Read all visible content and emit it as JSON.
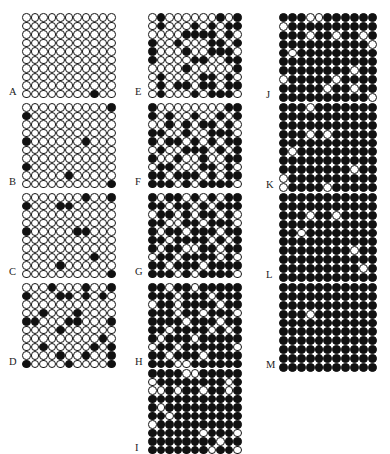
{
  "figure": {
    "type": "panel-matrix-of-circle-lattices",
    "legend": {
      "open_circle": "open circle (unoccupied / white)",
      "filled_circle": "filled circle (occupied / black)"
    },
    "columns": 3,
    "geometry": {
      "grid_cols": 11,
      "grid_rows": 10,
      "cell_px": 8.6,
      "circle_px": 8.6
    },
    "panels": [
      {
        "label": "A",
        "column": 1,
        "x": 26,
        "y": 13,
        "cell": 8.5,
        "rows": [
          "00000000000",
          "00000000000",
          "00000000000",
          "00000000000",
          "00000000000",
          "00000000000",
          "00000000000",
          "00000000000",
          "00000000000",
          "00000000100"
        ]
      },
      {
        "label": "B",
        "column": 1,
        "x": 26,
        "y": 103,
        "cell": 8.5,
        "rows": [
          "00000000001",
          "10000000000",
          "00000000000",
          "00000000000",
          "10000001000",
          "00000000000",
          "00000000000",
          "10000000000",
          "00000100000",
          "00000000001"
        ]
      },
      {
        "label": "C",
        "column": 1,
        "x": 26,
        "y": 193,
        "cell": 8.5,
        "rows": [
          "00000001001",
          "10001100000",
          "00000000000",
          "00000000000",
          "10000011000",
          "00000000000",
          "00000000000",
          "00000000100",
          "00001000000",
          "00000000001"
        ]
      },
      {
        "label": "D",
        "column": 1,
        "x": 26,
        "y": 283,
        "cell": 8.5,
        "rows": [
          "00010001001",
          "10001101010",
          "00000000000",
          "00100010000",
          "11000110001",
          "00001000000",
          "00000000010",
          "00100000101",
          "00001001001",
          "10000100001"
        ]
      },
      {
        "label": "E",
        "column": 2,
        "x": 152,
        "y": 13,
        "cell": 8.5,
        "rows": [
          "01000000101",
          "01000101011",
          "00001111010",
          "10010001101",
          "10001001110",
          "10000110011",
          "00001000001",
          "01000011010",
          "01011011011",
          "01000101110"
        ]
      },
      {
        "label": "F",
        "column": 2,
        "x": 152,
        "y": 103,
        "cell": 8.5,
        "rows": [
          "10000000011",
          "10100100101",
          "00101011010",
          "11001001110",
          "10110101011",
          "01001110101",
          "10010010011",
          "01100011010",
          "11011101011",
          "11101011110"
        ]
      },
      {
        "label": "G",
        "column": 2,
        "x": 152,
        "y": 193,
        "cell": 8.5,
        "rows": [
          "10110101011",
          "11011010111",
          "01101011010",
          "11001101110",
          "10110111011",
          "11011110101",
          "10110011011",
          "01101111010",
          "11011101111",
          "11101011110"
        ]
      },
      {
        "label": "H",
        "column": 2,
        "x": 152,
        "y": 283,
        "cell": 8.5,
        "rows": [
          "11011011111",
          "11101110111",
          "01101111011",
          "11101101110",
          "11110111011",
          "11011110101",
          "10111011111",
          "01101111110",
          "11011101111",
          "11100111111"
        ]
      },
      {
        "label": "I",
        "column": 2,
        "x": 152,
        "y": 369,
        "cell": 8.5,
        "rows": [
          "11110011111",
          "01111111101",
          "00101101101",
          "11111111111",
          "10111111111",
          "11011111111",
          "01111111111",
          "11111101110",
          "11111111011",
          "11111110110"
        ]
      },
      {
        "label": "J",
        "column": 3,
        "x": 283,
        "y": 13,
        "cell": 8.9,
        "rows": [
          "11100111111",
          "01111111111",
          "11101101101",
          "11111111110",
          "10111111111",
          "11111111111",
          "11111111011",
          "01111101111",
          "11111011011",
          "11111111110"
        ]
      },
      {
        "label": "K",
        "column": 3,
        "x": 283,
        "y": 103,
        "cell": 8.9,
        "rows": [
          "11101111111",
          "11111111111",
          "11111111111",
          "11101011111",
          "11111111111",
          "10111111111",
          "11111111111",
          "11111111011",
          "01111111111",
          "01111011111"
        ]
      },
      {
        "label": "L",
        "column": 3,
        "x": 283,
        "y": 193,
        "cell": 8.9,
        "rows": [
          "11111111111",
          "11111111111",
          "11101101111",
          "11111111111",
          "11011111111",
          "11111111111",
          "11111111011",
          "11111111111",
          "11111111101",
          "11111111111"
        ]
      },
      {
        "label": "M",
        "column": 3,
        "x": 283,
        "y": 283,
        "cell": 8.9,
        "rows": [
          "11111111111",
          "11111111111",
          "11111111111",
          "11101111111",
          "11111111111",
          "11111111111",
          "11111111111",
          "11111111111",
          "11111111111",
          "11111111111"
        ]
      }
    ]
  }
}
